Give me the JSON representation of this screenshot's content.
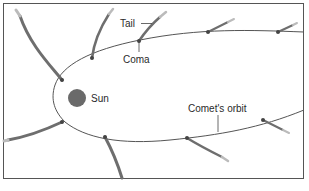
{
  "diagram": {
    "type": "comet-orbit",
    "labels": {
      "tail": "Tail",
      "coma": "Coma",
      "sun": "Sun",
      "orbit": "Comet's orbit"
    },
    "colors": {
      "frame": "#555555",
      "orbit": "#555555",
      "sun": "#6a6a6a",
      "tail": "#6e6e6e",
      "text": "#2a2a2a",
      "background": "#ffffff"
    },
    "comet_count": 8
  }
}
